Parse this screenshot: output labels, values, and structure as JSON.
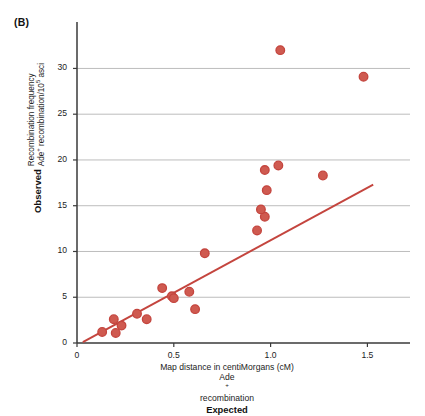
{
  "panel": {
    "label": "(B)"
  },
  "axes": {
    "y_title_bold": "Observed",
    "y_title_line1": "Recombination frequency",
    "y_title_line2_pre": "Ade",
    "y_title_line2_sup": "+",
    "y_title_line2_post": " recombination/10",
    "y_title_line2_sup2": "5",
    "y_title_line2_tail": " asci",
    "x_title_line1": "Map distance in centiMorgans (cM)",
    "x_title_line2_pre": "Ade",
    "x_title_line2_sup": "+",
    "x_title_line2_post": " recombination",
    "x_title_bold": "Expected",
    "y_ticks": [
      0,
      5,
      10,
      15,
      20,
      25,
      30
    ],
    "x_ticks": [
      0,
      0.5,
      1.0,
      1.5
    ],
    "x_tick_labels": [
      "0",
      "0.5",
      "1.0",
      "1.5"
    ],
    "y_tick_labels": [
      "0",
      "5",
      "10",
      "15",
      "20",
      "25",
      "30"
    ],
    "xlim": [
      0,
      1.72
    ],
    "ylim": [
      0,
      34.2
    ],
    "gridlines_y": [
      5,
      10,
      15,
      20,
      25,
      30
    ]
  },
  "colors": {
    "marker": "#c4453e",
    "marker_fill": "#cf5a50",
    "trendline": "#c4453e",
    "axis": "#3a3a3a",
    "grid": "#b4b4b4",
    "text": "#1d1d1d"
  },
  "chart_data": {
    "type": "scatter",
    "title": "(B)",
    "xlabel": "Map distance in centiMorgans (cM) — Ade+ recombination (Expected)",
    "ylabel": "Recombination frequency Ade+ recombination/10^5 asci (Observed)",
    "xlim": [
      0,
      1.72
    ],
    "ylim": [
      0,
      34.2
    ],
    "grid": "horizontal",
    "legend": "none",
    "points": [
      {
        "x": 0.13,
        "y": 1.2
      },
      {
        "x": 0.19,
        "y": 2.6
      },
      {
        "x": 0.2,
        "y": 1.1
      },
      {
        "x": 0.23,
        "y": 1.9
      },
      {
        "x": 0.31,
        "y": 3.2
      },
      {
        "x": 0.36,
        "y": 2.6
      },
      {
        "x": 0.44,
        "y": 6.0
      },
      {
        "x": 0.49,
        "y": 5.1
      },
      {
        "x": 0.5,
        "y": 4.9
      },
      {
        "x": 0.58,
        "y": 5.6
      },
      {
        "x": 0.61,
        "y": 3.7
      },
      {
        "x": 0.66,
        "y": 9.8
      },
      {
        "x": 0.93,
        "y": 12.3
      },
      {
        "x": 0.97,
        "y": 13.8
      },
      {
        "x": 0.95,
        "y": 14.6
      },
      {
        "x": 0.98,
        "y": 16.7
      },
      {
        "x": 0.97,
        "y": 18.9
      },
      {
        "x": 1.04,
        "y": 19.4
      },
      {
        "x": 1.27,
        "y": 18.3
      },
      {
        "x": 1.05,
        "y": 32.0
      },
      {
        "x": 1.48,
        "y": 29.1
      }
    ],
    "trendline": {
      "x0": 0.03,
      "y0": 0.1,
      "x1": 1.53,
      "y1": 17.3
    }
  }
}
